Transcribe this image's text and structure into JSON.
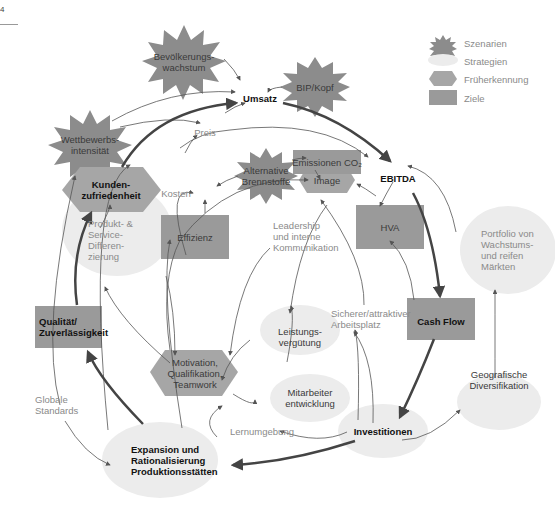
{
  "page": {
    "corner_label": "4"
  },
  "legend": [
    {
      "shape": "starburst",
      "label": "Szenarien",
      "color": "#8c8c8c"
    },
    {
      "shape": "ellipse",
      "label": "Strategien",
      "color": "#ececec"
    },
    {
      "shape": "hexagon",
      "label": "Früherkennung",
      "color": "#a6a6a6"
    },
    {
      "shape": "rectangle",
      "label": "Ziele",
      "color": "#9a9a9a"
    }
  ],
  "nodes": {
    "bevoelkerung": {
      "type": "szenario",
      "label": "Bevölkerungs-\nwachstum"
    },
    "bip": {
      "type": "szenario",
      "label": "BIP/Kopf"
    },
    "wettbewerb": {
      "type": "szenario",
      "label": "Wettbewerbs-\nintensität"
    },
    "alternative": {
      "type": "szenario",
      "label": "Alternative\nBrennstoffe"
    },
    "umsatz": {
      "type": "variable",
      "label": "Umsatz"
    },
    "preis": {
      "type": "variable",
      "label": "Preis"
    },
    "ebitda": {
      "type": "variable",
      "label": "EBITDA"
    },
    "kosten": {
      "type": "variable",
      "label": "Kosten"
    },
    "emissionen": {
      "type": "ziel",
      "label": "Emissionen  CO₂"
    },
    "image": {
      "type": "frueherkennung",
      "label": "Image"
    },
    "kunden": {
      "type": "frueherkennung",
      "label": "Kunden-\nzufriedenheit"
    },
    "effizienz": {
      "type": "ziel",
      "label": "Effizienz"
    },
    "hva": {
      "type": "ziel",
      "label": "HVA"
    },
    "leadership": {
      "type": "variable",
      "label": "Leadership\nund interne\nKommunikation"
    },
    "portfolio": {
      "type": "strategie",
      "label": "Portfolio von\nWachstums-\nund reifen\nMärkten"
    },
    "produkt": {
      "type": "strategie",
      "label": "Produkt- &\nService-\nDifferen-\nzierung"
    },
    "qualitaet": {
      "type": "ziel",
      "label": "Qualität/\nZuverlässigkeit"
    },
    "cashflow": {
      "type": "ziel",
      "label": "Cash Flow"
    },
    "sicherer": {
      "type": "variable",
      "label": "Sicherer/attraktiver\nArbeitsplatz"
    },
    "leistung": {
      "type": "strategie",
      "label": "Leistungs-\nvergütung"
    },
    "motivation": {
      "type": "frueherkennung",
      "label": "Motivation,\nQualifikation,\nTeamwork"
    },
    "mitarbeiter": {
      "type": "strategie",
      "label": "Mitarbeiter\nentwicklung"
    },
    "geografisch": {
      "type": "strategie",
      "label": "Geografische\nDiversifikation"
    },
    "globale": {
      "type": "variable",
      "label": "Globale\nStandards"
    },
    "lernumgebung": {
      "type": "variable",
      "label": "Lernumgebung"
    },
    "investitionen": {
      "type": "strategie",
      "label": "Investitionen"
    },
    "expansion": {
      "type": "strategie",
      "label": "Expansion und\nRationalisierung\nProduktionsstätten"
    }
  },
  "colors": {
    "szenario": "#8c8c8c",
    "strategie": "#ececec",
    "frueherkennung": "#a6a6a6",
    "ziel": "#9a9a9a",
    "arrow": "#555555",
    "arrow_bold": "#444444"
  }
}
